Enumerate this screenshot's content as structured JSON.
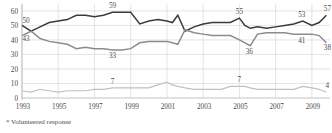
{
  "footnote": "* Volunteered response",
  "chart_data": {
    "type": "line",
    "title": "",
    "subtitle": "",
    "xlabel": "",
    "ylabel": "",
    "xlim": [
      1993,
      2010
    ],
    "ylim": [
      0,
      62
    ],
    "yticks": [
      0,
      10,
      20,
      30,
      40,
      50,
      60
    ],
    "ytick_labels": [
      "0",
      "10",
      "20",
      "30",
      "40",
      "50",
      "60"
    ],
    "xticks": [
      1993,
      1995,
      1997,
      1999,
      2001,
      2003,
      2005,
      2007,
      2009
    ],
    "xtick_labels": [
      "1993",
      "1995",
      "1997",
      "1999",
      "2001",
      "2003",
      "2005",
      "2007",
      "2009"
    ],
    "grid": "both",
    "legend_position": "none",
    "x": [
      1993,
      1993.5,
      1994,
      1994.5,
      1995,
      1995.5,
      1996,
      1996.5,
      1997,
      1997.5,
      1998,
      1998.5,
      1999,
      1999.5,
      2000,
      2000.5,
      2001,
      2001.3,
      2001.6,
      2002,
      2002.5,
      2003,
      2003.5,
      2004,
      2004.5,
      2005,
      2005.3,
      2005.6,
      2006,
      2006.5,
      2007,
      2007.5,
      2008,
      2008.5,
      2009,
      2009.4,
      2009.8
    ],
    "series": [
      {
        "name": "dark-series",
        "color": "#3b3b3b",
        "width": 1.5,
        "values": [
          50,
          46,
          49,
          52,
          53,
          54,
          57,
          57,
          56,
          57,
          59,
          59,
          59,
          51,
          53,
          54,
          53,
          52,
          57,
          46,
          49,
          51,
          52,
          52,
          52,
          55,
          50,
          48,
          49,
          48,
          49,
          50,
          51,
          53,
          50,
          52,
          57
        ]
      },
      {
        "name": "gray-series",
        "color": "#8c8c8c",
        "width": 1.5,
        "values": [
          43,
          46,
          41,
          39,
          38,
          37,
          34,
          35,
          34,
          34,
          33,
          33,
          34,
          38,
          39,
          39,
          39,
          38,
          37,
          47,
          45,
          44,
          43,
          43,
          43,
          40,
          38,
          36,
          44,
          45,
          45,
          45,
          44,
          44,
          44,
          43,
          38
        ]
      },
      {
        "name": "light-series",
        "color": "#c0c0c0",
        "width": 1.2,
        "values": [
          5,
          4,
          6,
          5,
          4,
          5,
          5,
          5,
          6,
          6,
          7,
          7,
          7,
          7,
          7,
          9,
          11,
          9,
          8,
          7,
          6,
          6,
          6,
          6,
          8,
          8,
          8,
          7,
          6,
          6,
          6,
          6,
          6,
          8,
          7,
          6,
          4
        ]
      }
    ],
    "point_labels": [
      {
        "text": "50",
        "x": 1993,
        "y": 50,
        "dx": 4,
        "dy": -2,
        "series": "dark-series"
      },
      {
        "text": "43",
        "x": 1993,
        "y": 43,
        "dx": 4,
        "dy": 5,
        "series": "gray-series"
      },
      {
        "text": "59",
        "x": 1998,
        "y": 59,
        "dx": 0,
        "dy": -4,
        "series": "dark-series"
      },
      {
        "text": "33",
        "x": 1998,
        "y": 33,
        "dx": 0,
        "dy": 8,
        "series": "gray-series"
      },
      {
        "text": "7",
        "x": 1998,
        "y": 7,
        "dx": 0,
        "dy": -4,
        "series": "light-series"
      },
      {
        "text": "55",
        "x": 2005,
        "y": 55,
        "dx": 0,
        "dy": -4,
        "series": "dark-series"
      },
      {
        "text": "36",
        "x": 2005.6,
        "y": 36,
        "dx": -1,
        "dy": 8,
        "series": "gray-series"
      },
      {
        "text": "7",
        "x": 2005,
        "y": 8,
        "dx": 0,
        "dy": -4,
        "series": "light-series"
      },
      {
        "text": "53",
        "x": 2008.5,
        "y": 53,
        "dx": -1,
        "dy": -4,
        "series": "dark-series"
      },
      {
        "text": "41",
        "x": 2008.5,
        "y": 44,
        "dx": -1,
        "dy": 9,
        "series": "gray-series"
      },
      {
        "text": "57",
        "x": 2009.8,
        "y": 57,
        "dx": 1,
        "dy": -4,
        "series": "dark-series"
      },
      {
        "text": "38",
        "x": 2009.8,
        "y": 38,
        "dx": 1,
        "dy": 7,
        "series": "gray-series"
      },
      {
        "text": "4",
        "x": 2009.8,
        "y": 4,
        "dx": 1,
        "dy": -4,
        "series": "light-series"
      }
    ]
  }
}
